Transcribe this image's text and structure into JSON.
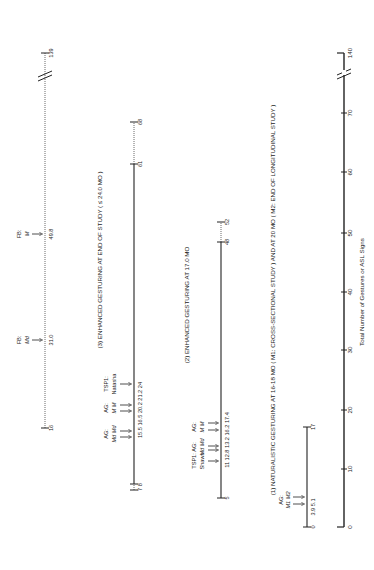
{
  "axis": {
    "label": "Total Number of Gestures or ASL Signs",
    "ticks": [
      "0",
      "10",
      "20",
      "30",
      "40",
      "50",
      "60",
      "70",
      "140"
    ]
  },
  "panels": {
    "p1": {
      "title": "(1) NATURALISTIC GESTURING AT 16-18 MO ( M1: CROSS-SECTIONAL STUDY ) AND AT 20 MO ( M2: END OF LONGITUDINAL STUDY )",
      "start": "0",
      "end": "17",
      "group_label": "AG:",
      "group_sub": "M1 M2",
      "values": "3.9  5.1"
    },
    "p2": {
      "title": "(2) ENHANCED GESTURING AT 17.0 MO",
      "start": "5",
      "end": "52",
      "mid": "48",
      "g1_label": "TSP1:",
      "g1_sub": "Shawn",
      "g2_label": "AG:",
      "g2_sub": "Md Md",
      "g3_label": "AG:",
      "g3_sub": "M M",
      "values": "11 12.8 13.2 16.2 17.4"
    },
    "p3": {
      "title": "(3) ENHANCED GESTURING AT END OF STUDY ( ≤ 24.0 MO )",
      "start": "7 8",
      "end": "68",
      "mid": "61",
      "g1_label": "AG:",
      "g1_sub": "Md Md",
      "g2_label": "AG:",
      "g2_sub": "M M",
      "g3_label": "TSP1:",
      "g3_sub": "Natasha",
      "values": "15.5 16.5  20.2 21.2  24"
    },
    "p4": {
      "start": "16",
      "end": "139",
      "fb1_label": "FB:",
      "fb1_sub": "Md",
      "fb1_value": "31.0",
      "fb2_label": "FB:",
      "fb2_sub": "M",
      "fb2_value": "49.8"
    }
  }
}
